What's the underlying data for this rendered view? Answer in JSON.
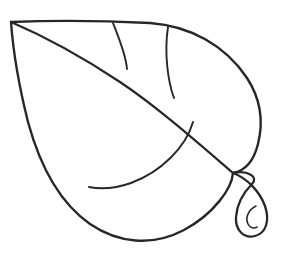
{
  "artwork": {
    "title": "Leaf Outline Drawing",
    "subject": "leaf",
    "style": "black line art on white background",
    "fill": "none",
    "canvas": {
      "width": 285,
      "height": 262,
      "background": "#ffffff"
    },
    "stroke_color": "#2a2628",
    "stroke_widths": {
      "outline": 2.4,
      "midrib": 2.2,
      "vein": 1.9,
      "stem": 2.3,
      "curl": 1.6
    }
  },
  "shapes": {
    "leaf_blade_outline": {
      "name": "leaf-blade-outline",
      "description": "Closed teardrop blade: apex at upper-left, broad lobe bulging to the right, rounded base at bottom.",
      "apex_point": [
        11,
        22
      ],
      "widest_right_x": 262,
      "lowest_y": 238,
      "base_junction": [
        233,
        173
      ],
      "path": "M11,22 C60,20 110,21 150,23 C190,26 225,45 247,78 C262,101 263,124 258,144 C253,164 244,171 233,173 C232,188 214,214 184,230 C152,247 118,243 90,224 C60,203 40,166 28,122 C20,90 13,50 11,22 Z"
    },
    "midrib": {
      "name": "leaf-midrib",
      "description": "Central vein running from the apex down-right to the base junction where the stem attaches.",
      "from": [
        11,
        22
      ],
      "to": [
        233,
        173
      ],
      "path": "M11,22 C46,37 84,58 120,82 C156,106 196,141 233,173"
    },
    "upper_vein_1": {
      "name": "leaf-vein-upper-1",
      "description": "First lateral vein: from the top outline down to the midrib.",
      "from": [
        113,
        23
      ],
      "to": [
        127,
        69
      ],
      "path": "M113,23 C119,38 126,55 127,69"
    },
    "upper_vein_2": {
      "name": "leaf-vein-upper-2",
      "description": "Second lateral vein: from the top outline down to the midrib.",
      "from": [
        168,
        27
      ],
      "to": [
        174,
        98
      ],
      "path": "M168,27 C164,53 168,82 174,98"
    },
    "lower_vein": {
      "name": "leaf-vein-lower",
      "description": "Long sweeping vein from the midrib curving down-left to the lower outline.",
      "from": [
        193,
        122
      ],
      "to": [
        89,
        187
      ],
      "path": "M193,122 C186,147 161,172 131,183 C114,189 99,189 89,187"
    },
    "stem": {
      "name": "leaf-stem",
      "description": "Petiole: tapering curved stalk leaving the base junction, bending right and down to a rounded tip.",
      "from": [
        233,
        173
      ],
      "tip": [
        262,
        232
      ],
      "path": "M233,173 C247,178 260,192 265,206 C270,221 266,233 255,236 C244,239 235,230 236,217 C237,204 244,192 252,184 C259,177 248,170 233,173 Z"
    },
    "stem_curl": {
      "name": "leaf-stem-curl",
      "description": "Small C-shaped curl inside the rounded stem tip.",
      "path": "M256,206 C248,210 245,218 248,224 C250,228 254,229 257,227"
    }
  }
}
